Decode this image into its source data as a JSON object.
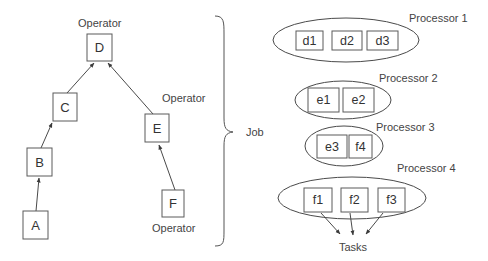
{
  "operator_graph": {
    "nodes": [
      {
        "id": "D",
        "label": "D",
        "x": 87,
        "y": 34,
        "w": 25,
        "h": 27
      },
      {
        "id": "C",
        "label": "C",
        "x": 53,
        "y": 93,
        "w": 24,
        "h": 28
      },
      {
        "id": "B",
        "label": "B",
        "x": 27,
        "y": 148,
        "w": 25,
        "h": 28
      },
      {
        "id": "A",
        "label": "A",
        "x": 23,
        "y": 211,
        "w": 25,
        "h": 28
      },
      {
        "id": "E",
        "label": "E",
        "x": 145,
        "y": 114,
        "w": 24,
        "h": 28
      },
      {
        "id": "F",
        "label": "F",
        "x": 162,
        "y": 190,
        "w": 22,
        "h": 27
      }
    ],
    "edges": [
      {
        "from": "A",
        "to": "B"
      },
      {
        "from": "B",
        "to": "C"
      },
      {
        "from": "C",
        "to": "D"
      },
      {
        "from": "E",
        "to": "D"
      },
      {
        "from": "F",
        "to": "E"
      }
    ],
    "operator_labels": {
      "top": "Operator",
      "middle": "Operator",
      "bottom": "Operator"
    }
  },
  "job_label": "Job",
  "processors": [
    {
      "name": "Processor 1",
      "tasks": [
        "d1",
        "d2",
        "d3"
      ]
    },
    {
      "name": "Processor 2",
      "tasks": [
        "e1",
        "e2"
      ]
    },
    {
      "name": "Processor 3",
      "tasks": [
        "e3",
        "f4"
      ]
    },
    {
      "name": "Processor 4",
      "tasks": [
        "f1",
        "f2",
        "f3"
      ]
    }
  ],
  "tasks_label": "Tasks",
  "colors": {
    "stroke": "#4a4a4a",
    "text": "#333333",
    "background": "#ffffff"
  }
}
